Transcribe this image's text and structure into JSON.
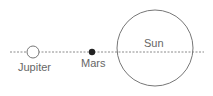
{
  "diagram": {
    "bodies": [
      {
        "id": "jupiter",
        "label": "Jupiter"
      },
      {
        "id": "mars",
        "label": "Mars"
      },
      {
        "id": "sun",
        "label": "Sun"
      }
    ],
    "colors": {
      "line": "#8a8a8a",
      "outline": "#777777",
      "mars_fill": "#222222",
      "text": "#666666"
    }
  }
}
